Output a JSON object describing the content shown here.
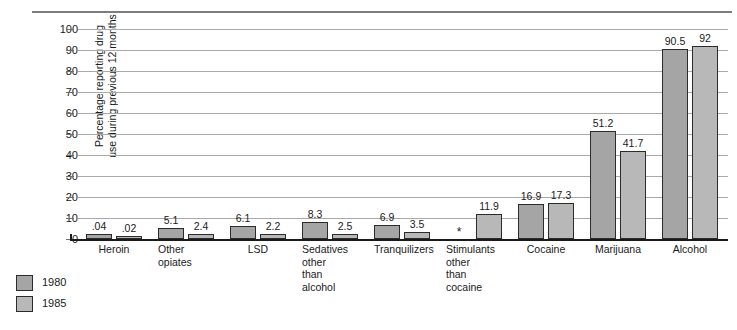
{
  "chart_data": {
    "type": "bar",
    "title": "",
    "xlabel": "",
    "ylabel": "Percentage reporting drug\nuse during previous 12 months",
    "ylim": [
      0,
      100
    ],
    "yticks": [
      100,
      90,
      80,
      70,
      60,
      50,
      40,
      30,
      20,
      10,
      0
    ],
    "grid": true,
    "legend_position": "bottom-left",
    "categories": [
      "Heroin",
      "Other\nopiates",
      "LSD",
      "Sedatives\nother\nthan\nalcohol",
      "Tranquilizers",
      "Stimulants\nother\nthan\ncocaine",
      "Cocaine",
      "Marijuana",
      "Alcohol"
    ],
    "series": [
      {
        "name": "1980",
        "color": "#a5a5a5",
        "values": [
          0.04,
          5.1,
          6.1,
          8.3,
          6.9,
          null,
          16.9,
          51.2,
          90.5
        ],
        "labels": [
          ".04",
          "5.1",
          "6.1",
          "8.3",
          "6.9",
          "*",
          "16.9",
          "51.2",
          "90.5"
        ]
      },
      {
        "name": "1985",
        "color": "#b8b8b8",
        "values": [
          0.02,
          2.4,
          2.2,
          2.5,
          3.5,
          11.9,
          17.3,
          41.7,
          92
        ],
        "labels": [
          ".02",
          "2.4",
          "2.2",
          "2.5",
          "3.5",
          "11.9",
          "17.3",
          "41.7",
          "92"
        ]
      }
    ]
  },
  "legend": {
    "items": [
      {
        "label": "1980",
        "swatch": "legend-swatch-1980"
      },
      {
        "label": "1985",
        "swatch": "legend-swatch-1985"
      }
    ]
  }
}
